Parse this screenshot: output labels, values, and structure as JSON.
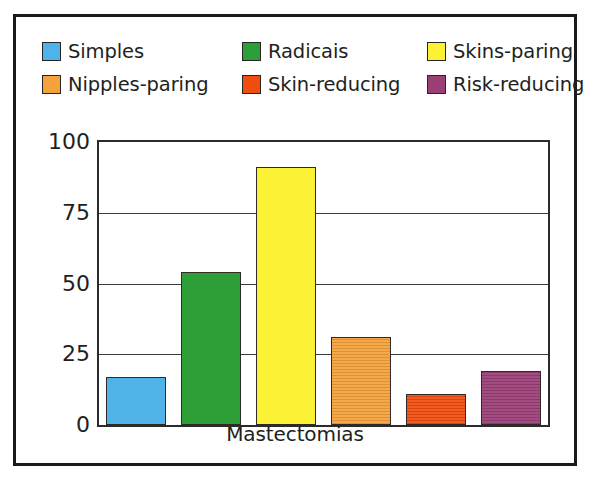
{
  "figure": {
    "frame_color": "#1a1a1a",
    "background": "#ffffff"
  },
  "legend": {
    "items": [
      {
        "label": "Simples",
        "color": "#4FB3E8"
      },
      {
        "label": "Radicais",
        "color": "#2E9E37"
      },
      {
        "label": "Skins-paring",
        "color": "#FBF235"
      },
      {
        "label": "Nipples-paring",
        "color": "#F5A23C"
      },
      {
        "label": "Skin-reducing",
        "color": "#F04E10"
      },
      {
        "label": "Risk-reducing",
        "color": "#9C3F78"
      }
    ]
  },
  "axis": {
    "y_ticks": [
      "0",
      "25",
      "50",
      "75",
      "100"
    ],
    "x_label": "Mastectomias"
  },
  "chart_data": {
    "type": "bar",
    "title": "",
    "xlabel": "Mastectomias",
    "ylabel": "",
    "ylim": [
      0,
      100
    ],
    "yticks": [
      0,
      25,
      50,
      75,
      100
    ],
    "grid": true,
    "legend_position": "top",
    "categories": [
      "Simples",
      "Radicais",
      "Skins-paring",
      "Nipples-paring",
      "Skin-reducing",
      "Risk-reducing"
    ],
    "values": [
      17,
      54,
      91,
      31,
      11,
      19
    ],
    "colors": [
      "#4FB3E8",
      "#2E9E37",
      "#FBF235",
      "#F5A23C",
      "#F04E10",
      "#9C3F78"
    ],
    "bar_edge_color": "#2f2a26"
  }
}
